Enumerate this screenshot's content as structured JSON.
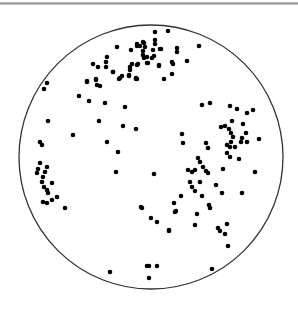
{
  "chart_data": {
    "type": "scatter",
    "title": "",
    "subtitle": "",
    "xlabel": "",
    "ylabel": "",
    "legend": [],
    "grid": false,
    "projection": "stereonet (equal-area pole plot)",
    "frame": {
      "shape": "circle",
      "cx": 151,
      "cy": 157,
      "r": 132,
      "stroke": "#333333"
    },
    "colors": {
      "point": "#000000",
      "frame": "#333333",
      "top_rule": "#aaaaaa",
      "background": "#ffffff"
    },
    "point_radius": 2.3,
    "points": [
      [
        155,
        32
      ],
      [
        168,
        31
      ],
      [
        155,
        40
      ],
      [
        155,
        44
      ],
      [
        143,
        42
      ],
      [
        144,
        43
      ],
      [
        137,
        44
      ],
      [
        137,
        46
      ],
      [
        140,
        46
      ],
      [
        145,
        47
      ],
      [
        117,
        47
      ],
      [
        131,
        50
      ],
      [
        143,
        51
      ],
      [
        143,
        55
      ],
      [
        144,
        58
      ],
      [
        147,
        57
      ],
      [
        152,
        58
      ],
      [
        153,
        50
      ],
      [
        154,
        56
      ],
      [
        160,
        49
      ],
      [
        161,
        49
      ],
      [
        177,
        48
      ],
      [
        177,
        52
      ],
      [
        187,
        61
      ],
      [
        199,
        46
      ],
      [
        107,
        57
      ],
      [
        106,
        62
      ],
      [
        93,
        64
      ],
      [
        98,
        67
      ],
      [
        106,
        67
      ],
      [
        113,
        72
      ],
      [
        130,
        67
      ],
      [
        130,
        70
      ],
      [
        132,
        64
      ],
      [
        137,
        65
      ],
      [
        138,
        64
      ],
      [
        147,
        63
      ],
      [
        148,
        63
      ],
      [
        159,
        65
      ],
      [
        159,
        66
      ],
      [
        172,
        62
      ],
      [
        173,
        64
      ],
      [
        87,
        81
      ],
      [
        96,
        79
      ],
      [
        120,
        78
      ],
      [
        129,
        76
      ],
      [
        136,
        78
      ],
      [
        136,
        79
      ],
      [
        164,
        79
      ],
      [
        172,
        74
      ],
      [
        47,
        83
      ],
      [
        44,
        89
      ],
      [
        87,
        82
      ],
      [
        96,
        80
      ],
      [
        97,
        85
      ],
      [
        100,
        86
      ],
      [
        113,
        72
      ],
      [
        119,
        79
      ],
      [
        122,
        76
      ],
      [
        129,
        75
      ],
      [
        137,
        79
      ],
      [
        79,
        96
      ],
      [
        89,
        101
      ],
      [
        105,
        103
      ],
      [
        125,
        107
      ],
      [
        48,
        121
      ],
      [
        99,
        121
      ],
      [
        123,
        126
      ],
      [
        136,
        129
      ],
      [
        73,
        135
      ],
      [
        107,
        142
      ],
      [
        40,
        142
      ],
      [
        42,
        145
      ],
      [
        40,
        163
      ],
      [
        38,
        169
      ],
      [
        37,
        173
      ],
      [
        47,
        167
      ],
      [
        45,
        172
      ],
      [
        43,
        177
      ],
      [
        42,
        182
      ],
      [
        44,
        187
      ],
      [
        47,
        190
      ],
      [
        52,
        183
      ],
      [
        48,
        193
      ],
      [
        43,
        202
      ],
      [
        47,
        203
      ],
      [
        52,
        200
      ],
      [
        57,
        197
      ],
      [
        65,
        208
      ],
      [
        202,
        105
      ],
      [
        210,
        103
      ],
      [
        230,
        106
      ],
      [
        237,
        109
      ],
      [
        247,
        113
      ],
      [
        253,
        110
      ],
      [
        232,
        121
      ],
      [
        243,
        124
      ],
      [
        221,
        127
      ],
      [
        225,
        126
      ],
      [
        229,
        129
      ],
      [
        231,
        133
      ],
      [
        233,
        137
      ],
      [
        231,
        142
      ],
      [
        246,
        133
      ],
      [
        242,
        138
      ],
      [
        241,
        142
      ],
      [
        247,
        142
      ],
      [
        259,
        139
      ],
      [
        182,
        134
      ],
      [
        183,
        143
      ],
      [
        206,
        143
      ],
      [
        208,
        148
      ],
      [
        227,
        145
      ],
      [
        230,
        147
      ],
      [
        235,
        147
      ],
      [
        227,
        153
      ],
      [
        230,
        157
      ],
      [
        239,
        159
      ],
      [
        198,
        158
      ],
      [
        200,
        162
      ],
      [
        188,
        170
      ],
      [
        192,
        172
      ],
      [
        195,
        170
      ],
      [
        203,
        167
      ],
      [
        206,
        171
      ],
      [
        208,
        173
      ],
      [
        190,
        182
      ],
      [
        192,
        187
      ],
      [
        200,
        182
      ],
      [
        195,
        191
      ],
      [
        223,
        169
      ],
      [
        216,
        185
      ],
      [
        222,
        193
      ],
      [
        242,
        193
      ],
      [
        255,
        172
      ],
      [
        181,
        196
      ],
      [
        202,
        196
      ],
      [
        174,
        203
      ],
      [
        175,
        212
      ],
      [
        176,
        211
      ],
      [
        209,
        205
      ],
      [
        210,
        208
      ],
      [
        197,
        214
      ],
      [
        195,
        225
      ],
      [
        169,
        230
      ],
      [
        169,
        231
      ],
      [
        218,
        228
      ],
      [
        220,
        231
      ],
      [
        227,
        224
      ],
      [
        225,
        234
      ],
      [
        228,
        246
      ],
      [
        118,
        152
      ],
      [
        116,
        172
      ],
      [
        154,
        174
      ],
      [
        141,
        207
      ],
      [
        142,
        208
      ],
      [
        151,
        218
      ],
      [
        157,
        222
      ],
      [
        110,
        272
      ],
      [
        147,
        266
      ],
      [
        149,
        266
      ],
      [
        157,
        266
      ],
      [
        212,
        269
      ],
      [
        149,
        278
      ]
    ]
  }
}
